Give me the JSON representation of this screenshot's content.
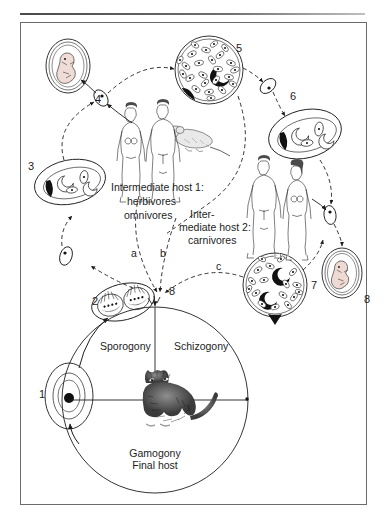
{
  "figure": {
    "stage_numbers": [
      "1",
      "2",
      "3",
      "4",
      "5",
      "6",
      "7",
      "8",
      "8"
    ],
    "route_letters": [
      "a",
      "b",
      "c"
    ],
    "labels": {
      "intermediate_host_1_line1": "Intermediate host 1:",
      "intermediate_host_1_line2": "herbivores",
      "intermediate_host_1_line3": "omnivores",
      "intermediate_host_2_line1": "Inter-",
      "intermediate_host_2_line2": "mediate host 2:",
      "intermediate_host_2_line3": "carnivores",
      "sporogony": "Sporogony",
      "schizogony": "Schizogony",
      "gamogony_line1": "Gamogony",
      "gamogony_line2": "Final host"
    },
    "stages": [
      {
        "id": "1",
        "name": "unsporulated-oocyst",
        "number": "1"
      },
      {
        "id": "2",
        "name": "sporulated-oocyst",
        "number": "2"
      },
      {
        "id": "3",
        "name": "tachyzoite-group-left",
        "number": "3"
      },
      {
        "id": "4",
        "name": "fetus-left",
        "number": "4"
      },
      {
        "id": "5",
        "name": "tissue-cyst-top",
        "number": "5"
      },
      {
        "id": "6",
        "name": "tachyzoite-group-right",
        "number": "6"
      },
      {
        "id": "7",
        "name": "tissue-cyst-bottom",
        "number": "7"
      },
      {
        "id": "8",
        "name": "fetus-right",
        "number": "8"
      },
      {
        "id": "8b",
        "name": "ingestion-point",
        "number": "8"
      }
    ],
    "animals": [
      {
        "name": "cat-final-host"
      },
      {
        "name": "mouse-intermediate-host"
      },
      {
        "name": "human-female-host-1"
      },
      {
        "name": "human-male-host-1"
      },
      {
        "name": "human-male-host-2"
      },
      {
        "name": "human-female-host-2"
      }
    ],
    "colors": {
      "line": "#1d1d1d",
      "frame": "#6b6b6b",
      "rule": "#4a4a4a",
      "fill_dark": "#111111",
      "background": "#ffffff"
    }
  }
}
